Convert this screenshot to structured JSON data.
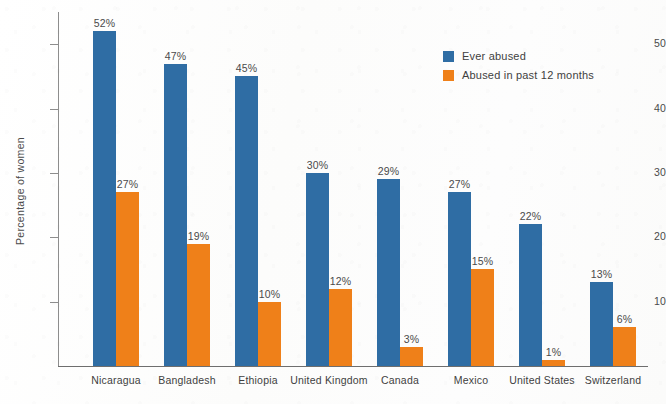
{
  "chart_data": {
    "type": "bar",
    "title": "",
    "xlabel": "",
    "ylabel": "Percentage of women",
    "ylim": [
      0,
      55
    ],
    "yticks": [
      10,
      20,
      30,
      40,
      50
    ],
    "ytick_labels": [
      "10",
      "20",
      "30",
      "40",
      "50"
    ],
    "grid": false,
    "legend_position": "upper right",
    "value_label_suffix": "%",
    "categories": [
      "Nicaragua",
      "Bangladesh",
      "Ethiopia",
      "United Kingdom",
      "Canada",
      "Mexico",
      "United States",
      "Switzerland"
    ],
    "series": [
      {
        "name": "Ever abused",
        "color": "#2f6da4",
        "values": [
          52,
          47,
          45,
          30,
          29,
          27,
          22,
          13
        ],
        "labels": [
          "52%",
          "47%",
          "45%",
          "30%",
          "29%",
          "27%",
          "22%",
          "13%"
        ]
      },
      {
        "name": "Abused in past 12 months",
        "color": "#ef8019",
        "values": [
          27,
          19,
          10,
          12,
          3,
          15,
          1,
          6
        ],
        "labels": [
          "27%",
          "19%",
          "10%",
          "12%",
          "3%",
          "15%",
          "1%",
          "6%"
        ]
      }
    ]
  },
  "axes": {
    "y_title": "Percentage of women"
  },
  "legend": {
    "items": [
      {
        "label": "Ever abused",
        "color": "#2f6da4"
      },
      {
        "label": "Abused in past 12 months",
        "color": "#ef8019"
      }
    ]
  },
  "colors": {
    "series_ever_abused": "#2f6da4",
    "series_past_12_months": "#ef8019",
    "axis": "#8d8d8d",
    "text": "#3f3f3f",
    "background": "#fdfdfc"
  }
}
